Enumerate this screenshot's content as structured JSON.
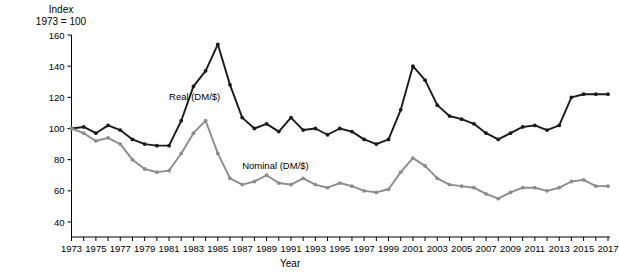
{
  "chart_data": {
    "type": "line",
    "title": "",
    "subtitle": "",
    "ylabel_line1": "Index",
    "ylabel_line2": "1973 = 100",
    "xlabel": "Year",
    "ylim": [
      30,
      165
    ],
    "yticks": [
      40,
      60,
      80,
      100,
      120,
      140,
      160
    ],
    "ytick_labels": [
      "40",
      "60",
      "80",
      "100",
      "120",
      "140",
      "160"
    ],
    "xlim": [
      1973,
      2017
    ],
    "xticks": [
      1973,
      1975,
      1977,
      1979,
      1981,
      1983,
      1985,
      1987,
      1989,
      1991,
      1993,
      1995,
      1997,
      1999,
      2001,
      2003,
      2005,
      2007,
      2009,
      2011,
      2013,
      2015,
      2017
    ],
    "xtick_labels": [
      "1973",
      "1975",
      "1977",
      "1979",
      "1981",
      "1983",
      "1985",
      "1987",
      "1989",
      "1991",
      "1993",
      "1995",
      "1997",
      "1999",
      "2001",
      "2003",
      "2005",
      "2007",
      "2009",
      "2011",
      "2013",
      "2015",
      "2017"
    ],
    "grid": false,
    "legend_position": "inline-annotation",
    "x": [
      1973,
      1974,
      1975,
      1976,
      1977,
      1978,
      1979,
      1980,
      1981,
      1982,
      1983,
      1984,
      1985,
      1986,
      1987,
      1988,
      1989,
      1990,
      1991,
      1992,
      1993,
      1994,
      1995,
      1996,
      1997,
      1998,
      1999,
      2000,
      2001,
      2002,
      2003,
      2004,
      2005,
      2006,
      2007,
      2008,
      2009,
      2010,
      2011,
      2012,
      2013,
      2014,
      2015,
      2016,
      2017
    ],
    "series": [
      {
        "name": "Real (DM/$)",
        "color": "#1a1a1a",
        "label_x": 1981,
        "label_y": 118,
        "values": [
          100,
          101,
          97,
          102,
          99,
          93,
          90,
          89,
          89,
          105,
          127,
          137,
          154,
          128,
          107,
          100,
          103,
          98,
          107,
          99,
          100,
          96,
          100,
          98,
          93,
          90,
          93,
          112,
          140,
          131,
          115,
          108,
          106,
          103,
          97,
          93,
          97,
          101,
          102,
          99,
          102,
          120,
          122,
          122,
          122
        ]
      },
      {
        "name": "Nominal (DM/$)",
        "color": "#8c8c8c",
        "label_x": 1987,
        "label_y": 74,
        "values": [
          100,
          97,
          92,
          94,
          90,
          80,
          74,
          72,
          73,
          84,
          97,
          105,
          84,
          68,
          64,
          66,
          70,
          65,
          64,
          68,
          64,
          62,
          65,
          63,
          60,
          59,
          61,
          72,
          81,
          76,
          68,
          64,
          63,
          62,
          58,
          55,
          59,
          62,
          62,
          60,
          62,
          66,
          67,
          63,
          63
        ]
      }
    ]
  }
}
